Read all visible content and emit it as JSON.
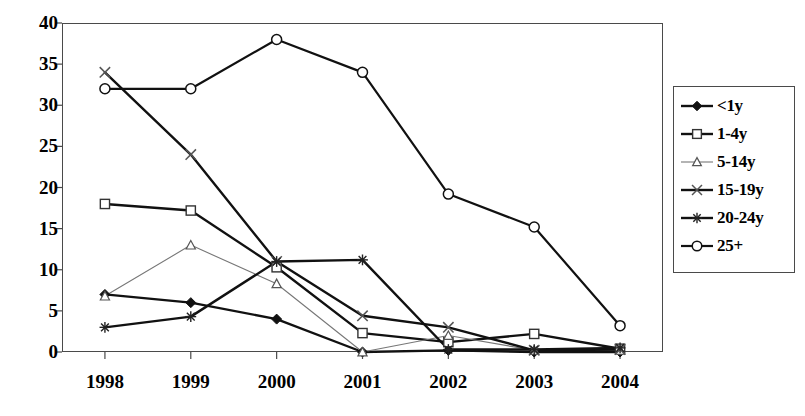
{
  "chart_data": {
    "type": "line",
    "title": "",
    "xlabel": "",
    "ylabel": "",
    "categories": [
      "1998",
      "1999",
      "2000",
      "2001",
      "2002",
      "2003",
      "2004"
    ],
    "ylim": [
      0,
      40
    ],
    "yticks": [
      0,
      5,
      10,
      15,
      20,
      25,
      30,
      35,
      40
    ],
    "grid": false,
    "legend_position": "right",
    "series": [
      {
        "name": "<1y",
        "marker": "filled-diamond",
        "values": [
          7.0,
          6.0,
          4.0,
          0.0,
          0.2,
          0.0,
          0.0
        ]
      },
      {
        "name": "1-4y",
        "marker": "open-square",
        "values": [
          18.0,
          17.2,
          10.3,
          2.3,
          1.2,
          2.2,
          0.4
        ]
      },
      {
        "name": "5-14y",
        "marker": "open-triangle",
        "values": [
          6.8,
          13.0,
          8.3,
          0.0,
          2.0,
          0.2,
          0.2
        ]
      },
      {
        "name": "15-19y",
        "marker": "x-cross",
        "values": [
          34.0,
          24.0,
          11.0,
          4.4,
          3.0,
          0.2,
          0.3
        ]
      },
      {
        "name": "20-24y",
        "marker": "asterisk",
        "values": [
          3.0,
          4.3,
          11.0,
          11.2,
          0.3,
          0.3,
          0.5
        ]
      },
      {
        "name": "25+",
        "marker": "open-circle",
        "values": [
          32.0,
          32.0,
          38.0,
          34.0,
          19.2,
          15.2,
          3.2
        ]
      }
    ]
  },
  "legend": {
    "items": [
      {
        "label": "<1y"
      },
      {
        "label": "1-4y"
      },
      {
        "label": "5-14y"
      },
      {
        "label": "15-19y"
      },
      {
        "label": "20-24y"
      },
      {
        "label": "25+"
      }
    ]
  }
}
